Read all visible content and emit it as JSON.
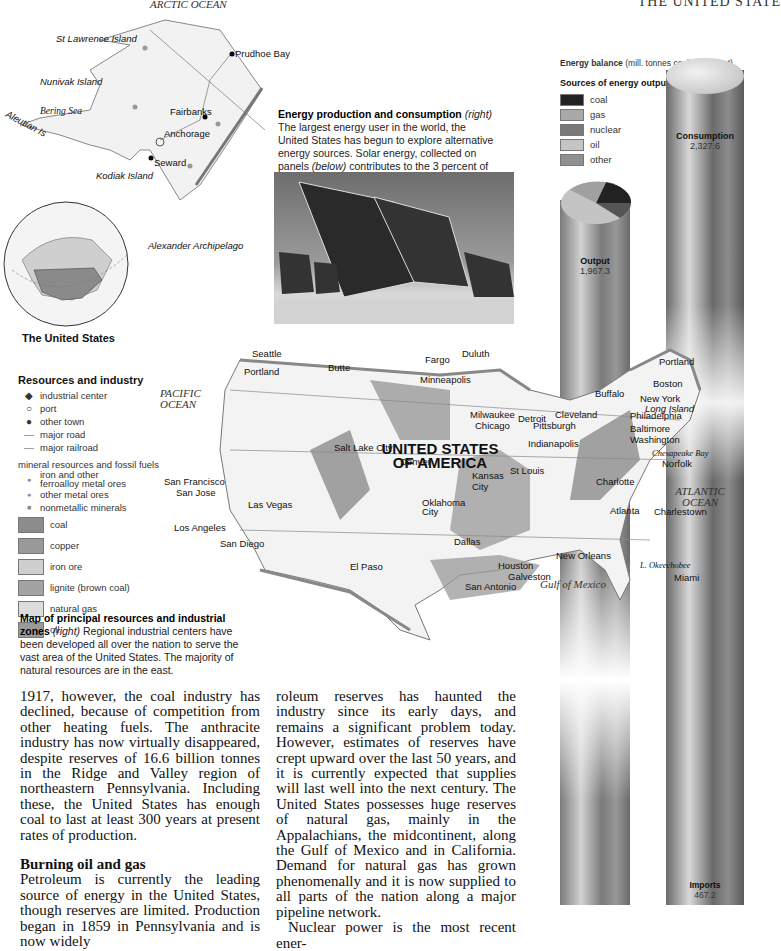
{
  "running_head": "THE UNITED STATE",
  "alaska_map": {
    "ocean": "ARCTIC OCEAN",
    "labels": [
      "St Lawrence Island",
      "Nunivak Island",
      "Bering Sea",
      "Aleutian Is",
      "Kodiak Island",
      "Alexander Archipelago",
      "Yukon",
      "Arctic Circle"
    ],
    "cities": [
      "Prudhoe Bay",
      "Fairbanks",
      "Anchorage",
      "Seward"
    ]
  },
  "globe": {
    "caption": "The United States"
  },
  "energy_caption": {
    "title": "Energy production and consumption",
    "qualifier": "(right)",
    "text_a": " The largest energy user in the world, the United States has begun to explore alternative energy sources. Solar energy, collected on panels ",
    "qualifier2": "(below)",
    "text_b": " contributes to the 3 percent of energy from \"other\" sources."
  },
  "energy_balance": {
    "title": "Energy balance",
    "unit": "(mill. tonnes coal equivalent)",
    "sources_title": "Sources of energy output",
    "sources": [
      {
        "label": "coal",
        "color": "#222222"
      },
      {
        "label": "gas",
        "color": "#a8a8a8"
      },
      {
        "label": "nuclear",
        "color": "#7a7a7a"
      },
      {
        "label": "oil",
        "color": "#c4c4c4"
      },
      {
        "label": "other",
        "color": "#909090"
      }
    ],
    "consumption": {
      "label": "Consumption",
      "value": "2,327.6"
    },
    "output": {
      "label": "Output",
      "value": "1,967.3"
    },
    "imports": {
      "label": "Imports",
      "value": "467.2"
    }
  },
  "resources_legend": {
    "title": "Resources and industry",
    "symbols": [
      {
        "sym": "◆",
        "label": "industrial center"
      },
      {
        "sym": "○",
        "label": "port"
      },
      {
        "sym": "●",
        "label": "other town"
      },
      {
        "sym": "—",
        "label": "major road"
      },
      {
        "sym": "—",
        "label": "major railroad"
      }
    ],
    "minerals_title": "mineral resources and fossil fuels",
    "minerals": [
      {
        "sym": "●",
        "label": "iron and other ferroalloy metal ores"
      },
      {
        "sym": "●",
        "label": "other metal ores"
      },
      {
        "sym": "■",
        "label": "nonmetallic minerals"
      }
    ],
    "areas": [
      {
        "label": "coal",
        "color": "#8c8c8c"
      },
      {
        "label": "copper",
        "color": "#999999"
      },
      {
        "label": "iron ore",
        "color": "#cfcfcf"
      },
      {
        "label": "lignite (brown coal)",
        "color": "#a3a3a3"
      },
      {
        "label": "natural gas",
        "color": "#dcdcdc"
      },
      {
        "label": "oil",
        "color": "#9a9a9a"
      }
    ]
  },
  "map_caption": {
    "title": "Map of principal resources and industrial zones",
    "qualifier": "(right)",
    "text": " Regional industrial centers have been developed all over the nation to serve the vast area of the United States. The majority of natural resources are in the east."
  },
  "us_map": {
    "country": "UNITED STATES OF AMERICA",
    "oceans": [
      "PACIFIC OCEAN",
      "ATLANTIC OCEAN",
      "Gulf of Mexico"
    ],
    "water_labels": [
      "Lake Superior",
      "Lake Michigan",
      "Lake Huron",
      "Lake Erie",
      "Lake Ontario",
      "Chesapeake Bay",
      "L. Okeechobee",
      "Long Island"
    ],
    "cities": [
      "Seattle",
      "Portland",
      "Butte",
      "Fargo",
      "Duluth",
      "Minneapolis",
      "Milwaukee",
      "Chicago",
      "Detroit",
      "Cleveland",
      "Pittsburgh",
      "Buffalo",
      "Portland",
      "Boston",
      "New York",
      "Philadelphia",
      "Baltimore",
      "Washington",
      "Norfolk",
      "Salt Lake City",
      "Denver",
      "Indianapolis",
      "St Louis",
      "Kansas City",
      "San Francisco",
      "San Jose",
      "Las Vegas",
      "Los Angeles",
      "San Diego",
      "Oklahoma City",
      "Charlotte",
      "Atlanta",
      "Charlestown",
      "El Paso",
      "Dallas",
      "Houston",
      "Galveston",
      "San Antonio",
      "New Orleans",
      "Miami"
    ]
  },
  "article": {
    "col1_p1": "1917, however, the coal industry has declined, because of competition from other heating fuels. The anthracite industry has now virtually disappeared, despite reserves of 16.6 billion tonnes in the Ridge and Valley region of northeastern Pennsylvania. Including these, the United States has enough coal to last at least 300 years at present rates of production.",
    "col1_heading": "Burning oil and gas",
    "col1_p2": "Petroleum is currently the leading source of energy in the United States, though reserves are limited. Production began in 1859 in Pennsylvania and is now widely",
    "col2_p1": "roleum reserves has haunted the industry since its early days, and remains a significant problem today. However, estimates of reserves have crept upward over the last 50 years, and it is currently expected that supplies will last well into the next century. The United States possesses huge reserves of natural gas, mainly in the Appalachians, the midcontinent, along the Gulf of Mexico and in California. Demand for natural gas has grown phenomenally and it is now supplied to all parts of the nation along a major pipeline network.",
    "col2_p2": "Nuclear power is the most recent ener-"
  }
}
